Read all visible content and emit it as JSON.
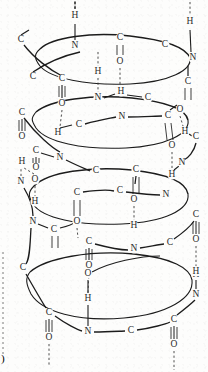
{
  "figure": {
    "kind": "alpha-helix-backbone-diagram",
    "title": "",
    "page_marker": ")"
  },
  "style": {
    "ink": "#1c1c1c",
    "atom_text": "#2b2b2b",
    "hbond": "#3a3a3a",
    "background": "#fdfdfc",
    "edge_mark": "#6a6a6a"
  },
  "legend": {
    "atom_symbols": [
      "C",
      "N",
      "O",
      "H"
    ],
    "bond_types": [
      "covalent-bond",
      "double-bond",
      "hydrogen-bond"
    ]
  },
  "coils": [
    {
      "id": "coil-1",
      "cx": 112,
      "cy": 57,
      "rx": 72,
      "ry": 24
    },
    {
      "id": "coil-2",
      "cx": 108,
      "cy": 121,
      "rx": 74,
      "ry": 25
    },
    {
      "id": "coil-3",
      "cx": 106,
      "cy": 196,
      "rx": 74,
      "ry": 27
    },
    {
      "id": "coil-4",
      "cx": 108,
      "cy": 283,
      "rx": 76,
      "ry": 29
    }
  ],
  "atoms": [
    {
      "id": "a1",
      "symbol": "H",
      "x": 75,
      "y": 16
    },
    {
      "id": "a2",
      "symbol": "N",
      "x": 75,
      "y": 46
    },
    {
      "id": "a3",
      "symbol": "C",
      "x": 120,
      "y": 38
    },
    {
      "id": "a4",
      "symbol": "O",
      "x": 120,
      "y": 62
    },
    {
      "id": "a5",
      "symbol": "C",
      "x": 165,
      "y": 45
    },
    {
      "id": "a6",
      "symbol": "H",
      "x": 190,
      "y": 22
    },
    {
      "id": "a7",
      "symbol": "N",
      "x": 193,
      "y": 58
    },
    {
      "id": "a8",
      "symbol": "C",
      "x": 21,
      "y": 40
    },
    {
      "id": "a9",
      "symbol": "H",
      "x": 98,
      "y": 72
    },
    {
      "id": "a10",
      "symbol": "C",
      "x": 33,
      "y": 77
    },
    {
      "id": "a11",
      "symbol": "C",
      "x": 62,
      "y": 79
    },
    {
      "id": "a12",
      "symbol": "C",
      "x": 188,
      "y": 82
    },
    {
      "id": "a13",
      "symbol": "O",
      "x": 62,
      "y": 104
    },
    {
      "id": "a14",
      "symbol": "N",
      "x": 98,
      "y": 98
    },
    {
      "id": "a15",
      "symbol": "H",
      "x": 121,
      "y": 92
    },
    {
      "id": "a16",
      "symbol": "C",
      "x": 148,
      "y": 98
    },
    {
      "id": "a17",
      "symbol": "C",
      "x": 22,
      "y": 113
    },
    {
      "id": "a18",
      "symbol": "N",
      "x": 122,
      "y": 117
    },
    {
      "id": "a19",
      "symbol": "C",
      "x": 79,
      "y": 125
    },
    {
      "id": "a20",
      "symbol": "C",
      "x": 168,
      "y": 116
    },
    {
      "id": "a21",
      "symbol": "O",
      "x": 180,
      "y": 110
    },
    {
      "id": "a22",
      "symbol": "H",
      "x": 58,
      "y": 133
    },
    {
      "id": "a23",
      "symbol": "O",
      "x": 22,
      "y": 137
    },
    {
      "id": "a24",
      "symbol": "H",
      "x": 185,
      "y": 132
    },
    {
      "id": "a25",
      "symbol": "C",
      "x": 196,
      "y": 137
    },
    {
      "id": "a26",
      "symbol": "C",
      "x": 36,
      "y": 151
    },
    {
      "id": "a27",
      "symbol": "N",
      "x": 60,
      "y": 158
    },
    {
      "id": "a28",
      "symbol": "H",
      "x": 22,
      "y": 162
    },
    {
      "id": "a29",
      "symbol": "O",
      "x": 36,
      "y": 168
    },
    {
      "id": "a30",
      "symbol": "O",
      "x": 172,
      "y": 146
    },
    {
      "id": "a31",
      "symbol": "N",
      "x": 182,
      "y": 163
    },
    {
      "id": "a32",
      "symbol": "C",
      "x": 96,
      "y": 171
    },
    {
      "id": "a33",
      "symbol": "C",
      "x": 136,
      "y": 170
    },
    {
      "id": "a34",
      "symbol": "H",
      "x": 172,
      "y": 175
    },
    {
      "id": "a35",
      "symbol": "N",
      "x": 21,
      "y": 182
    },
    {
      "id": "a36",
      "symbol": "O",
      "x": 35,
      "y": 180
    },
    {
      "id": "a37",
      "symbol": "C",
      "x": 77,
      "y": 193
    },
    {
      "id": "a38",
      "symbol": "C",
      "x": 120,
      "y": 191
    },
    {
      "id": "a39",
      "symbol": "N",
      "x": 166,
      "y": 195
    },
    {
      "id": "a40",
      "symbol": "H",
      "x": 35,
      "y": 202
    },
    {
      "id": "a41",
      "symbol": "O",
      "x": 134,
      "y": 200
    },
    {
      "id": "a42",
      "symbol": "N",
      "x": 33,
      "y": 222
    },
    {
      "id": "a43",
      "symbol": "C",
      "x": 54,
      "y": 230
    },
    {
      "id": "a44",
      "symbol": "O",
      "x": 77,
      "y": 222
    },
    {
      "id": "a45",
      "symbol": "C",
      "x": 196,
      "y": 215
    },
    {
      "id": "a46",
      "symbol": "O",
      "x": 196,
      "y": 240
    },
    {
      "id": "a47",
      "symbol": "H",
      "x": 134,
      "y": 226
    },
    {
      "id": "a48",
      "symbol": "C",
      "x": 89,
      "y": 242
    },
    {
      "id": "a49",
      "symbol": "N",
      "x": 134,
      "y": 249
    },
    {
      "id": "a50",
      "symbol": "C",
      "x": 170,
      "y": 243
    },
    {
      "id": "a51",
      "symbol": "O",
      "x": 89,
      "y": 266
    },
    {
      "id": "a52",
      "symbol": "H",
      "x": 196,
      "y": 275
    },
    {
      "id": "a53",
      "symbol": "C",
      "x": 23,
      "y": 268
    },
    {
      "id": "a54",
      "symbol": "O",
      "x": 88,
      "y": 274
    },
    {
      "id": "a55",
      "symbol": "H",
      "x": 88,
      "y": 299
    },
    {
      "id": "a56",
      "symbol": "H",
      "x": 196,
      "y": 272
    },
    {
      "id": "a57",
      "symbol": "N",
      "x": 196,
      "y": 295
    },
    {
      "id": "a58",
      "symbol": "C",
      "x": 49,
      "y": 313
    },
    {
      "id": "a59",
      "symbol": "N",
      "x": 88,
      "y": 332
    },
    {
      "id": "a60",
      "symbol": "C",
      "x": 131,
      "y": 331
    },
    {
      "id": "a61",
      "symbol": "C",
      "x": 174,
      "y": 320
    },
    {
      "id": "a62",
      "symbol": "O",
      "x": 49,
      "y": 338
    },
    {
      "id": "a63",
      "symbol": "O",
      "x": 174,
      "y": 345
    }
  ],
  "hydrogen_bonds": [
    {
      "id": "hb-1",
      "from": "a2",
      "to": "above-edge"
    },
    {
      "id": "hb-2",
      "from": "a6",
      "to": "above-edge"
    },
    {
      "id": "hb-3",
      "from": "a4",
      "to": "a9-column"
    },
    {
      "id": "hb-4",
      "from": "a13",
      "to": "a22"
    },
    {
      "id": "hb-5",
      "from": "a21",
      "to": "a24"
    },
    {
      "id": "hb-6",
      "from": "a29",
      "to": "a28"
    },
    {
      "id": "hb-7",
      "from": "a30",
      "to": "a34"
    },
    {
      "id": "hb-8",
      "from": "a41",
      "to": "a47"
    },
    {
      "id": "hb-9",
      "from": "a36",
      "to": "a40"
    },
    {
      "id": "hb-10",
      "from": "a46",
      "to": "a52"
    },
    {
      "id": "hb-11",
      "from": "a51",
      "to": "a55"
    },
    {
      "id": "hb-12",
      "from": "a62",
      "to": "below-edge"
    },
    {
      "id": "hb-13",
      "from": "a63",
      "to": "below-edge"
    }
  ]
}
